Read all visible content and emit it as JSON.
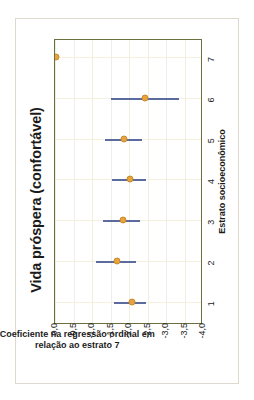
{
  "figure": {
    "title": "Vida próspera (confortável)"
  },
  "chart_data": {
    "type": "scatter",
    "title": "Vida próspera (confortável)",
    "xlabel": "Estrato socioeconômico",
    "ylabel": "Coeficiente  na regressão ordinal em relação ao estrato 7",
    "ylabel_line1": "Coeficiente  na regressão ordinal em",
    "ylabel_line2": "relação ao estrato 7",
    "orientation": "rotated-90-ccw",
    "grid": true,
    "legend": "none",
    "categories": [
      "1",
      "2",
      "3",
      "4",
      "5",
      "6",
      "7"
    ],
    "x": [
      1,
      2,
      3,
      4,
      5,
      6,
      7
    ],
    "xlim": [
      0.5,
      7.5
    ],
    "ylim": [
      -4.0,
      0.0
    ],
    "yticks": [
      "0,0",
      "-0,5",
      "-1,0",
      "-1,5",
      "-2,0",
      "-2,5",
      "-3,0",
      "-3,5",
      "-4,0"
    ],
    "ytick_values": [
      0.0,
      -0.5,
      -1.0,
      -1.5,
      -2.0,
      -2.5,
      -3.0,
      -3.5,
      -4.0
    ],
    "xticks": [
      "1",
      "2",
      "3",
      "4",
      "5",
      "6",
      "7"
    ],
    "series": [
      {
        "name": "Coeficiente",
        "marker_color": "#e8a33d",
        "errorbar_color": "#5b6b9e",
        "values": [
          -2.05,
          -1.65,
          -1.8,
          -2.0,
          -1.85,
          -2.4,
          0.0
        ],
        "ci_low": [
          -2.45,
          -2.2,
          -2.3,
          -2.45,
          -2.35,
          -3.35,
          0.0
        ],
        "ci_high": [
          -1.6,
          -1.1,
          -1.3,
          -1.55,
          -1.35,
          -1.5,
          0.0
        ]
      }
    ]
  }
}
